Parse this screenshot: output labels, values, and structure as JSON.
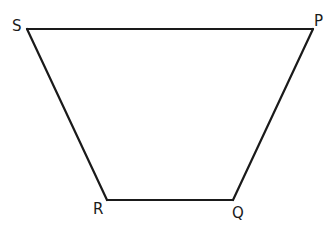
{
  "diagram": {
    "type": "quadrilateral",
    "shape": "trapezium",
    "colors": {
      "stroke": "#1a1a1a",
      "background": "#ffffff"
    },
    "vertices": [
      {
        "name": "S",
        "x": 27,
        "y": 29,
        "label_x": 12,
        "label_y": 31
      },
      {
        "name": "P",
        "x": 313,
        "y": 29,
        "label_x": 314,
        "label_y": 26
      },
      {
        "name": "Q",
        "x": 233,
        "y": 200,
        "label_x": 232,
        "label_y": 218
      },
      {
        "name": "R",
        "x": 107,
        "y": 200,
        "label_x": 93,
        "label_y": 214
      }
    ],
    "edges": [
      {
        "name": "SP",
        "from": "S",
        "to": "P"
      },
      {
        "name": "PQ",
        "from": "P",
        "to": "Q"
      },
      {
        "name": "QR",
        "from": "Q",
        "to": "R"
      },
      {
        "name": "RS",
        "from": "R",
        "to": "S"
      }
    ]
  }
}
